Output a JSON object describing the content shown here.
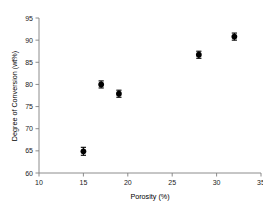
{
  "chart_data": {
    "type": "scatter",
    "title": "",
    "xlabel": "Porosity (%)",
    "ylabel": "Degree of Conversion (wt%)",
    "xlim": [
      10,
      35
    ],
    "ylim": [
      60,
      95
    ],
    "xticks": [
      10,
      15,
      20,
      25,
      30,
      35
    ],
    "yticks": [
      60,
      65,
      70,
      75,
      80,
      85,
      90,
      95
    ],
    "grid": false,
    "legend": false,
    "marker": "filled-circle",
    "marker_color": "#000000",
    "error_bars": "vertical",
    "x": [
      15,
      17,
      19,
      28,
      32
    ],
    "y": [
      64.9,
      80.0,
      77.9,
      86.7,
      90.8
    ],
    "yerr": [
      0.9,
      0.8,
      0.8,
      0.8,
      0.8
    ],
    "points": [
      {
        "x": 15,
        "y": 64.9,
        "yerr": 0.9
      },
      {
        "x": 17,
        "y": 80.0,
        "yerr": 0.8
      },
      {
        "x": 19,
        "y": 77.9,
        "yerr": 0.8
      },
      {
        "x": 28,
        "y": 86.7,
        "yerr": 0.8
      },
      {
        "x": 32,
        "y": 90.8,
        "yerr": 0.8
      }
    ]
  },
  "axes": {
    "x_tick_labels": [
      "10",
      "15",
      "20",
      "25",
      "30",
      "35"
    ],
    "y_tick_labels": [
      "60",
      "65",
      "70",
      "75",
      "80",
      "85",
      "90",
      "95"
    ],
    "x_axis_title": "Porosity (%)",
    "y_axis_title": "Degree of Conversion (wt%)"
  }
}
